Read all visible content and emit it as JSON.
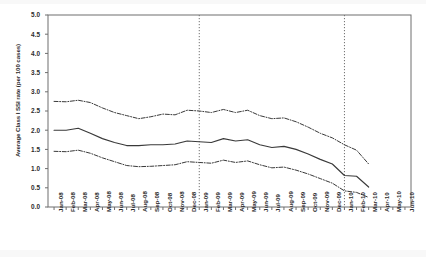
{
  "chart_data": {
    "type": "line",
    "title": "",
    "xlabel": "",
    "ylabel": "Average Class I SSI rate (per 100 cases)",
    "ylim": [
      0.0,
      5.0
    ],
    "ytick_labels": [
      "0.0",
      "0.5",
      "1.0",
      "1.5",
      "2.0",
      "2.5",
      "3.0",
      "3.5",
      "4.0",
      "4.5",
      "5.0"
    ],
    "ytick_values": [
      0.0,
      0.5,
      1.0,
      1.5,
      2.0,
      2.5,
      3.0,
      3.5,
      4.0,
      4.5,
      5.0
    ],
    "grid": false,
    "legend": "none",
    "categories": [
      "Jan-08",
      "Feb-08",
      "Mar-08",
      "Apr-08",
      "May-08",
      "Jun-08",
      "Jul-08",
      "Aug-08",
      "Sep-08",
      "Oct-08",
      "Nov-08",
      "Dec-08",
      "Jan-09",
      "Feb-09",
      "Mar-09",
      "Apr-09",
      "May-09",
      "Jun-09",
      "Jul-09",
      "Aug-09",
      "Sep-09",
      "Oct-09",
      "Nov-09",
      "Dec-09",
      "Jan-10",
      "Feb-10",
      "Mar-10",
      "Apr-10",
      "May-10",
      "Jun-10"
    ],
    "series": [
      {
        "name": "Upper control limit",
        "style": "dash-dot",
        "color": "#3a3a3a",
        "values": [
          2.75,
          2.74,
          2.78,
          2.72,
          2.58,
          2.46,
          2.38,
          2.3,
          2.35,
          2.42,
          2.4,
          2.52,
          2.5,
          2.46,
          2.54,
          2.46,
          2.52,
          2.38,
          2.3,
          2.32,
          2.22,
          2.08,
          1.92,
          1.8,
          1.62,
          1.48,
          1.12,
          null,
          null,
          null
        ]
      },
      {
        "name": "Average Class I SSI rate",
        "style": "solid",
        "color": "#3a3a3a",
        "values": [
          2.0,
          2.0,
          2.05,
          1.92,
          1.78,
          1.68,
          1.6,
          1.6,
          1.62,
          1.62,
          1.64,
          1.72,
          1.7,
          1.68,
          1.78,
          1.72,
          1.75,
          1.62,
          1.55,
          1.58,
          1.5,
          1.38,
          1.24,
          1.12,
          0.82,
          0.8,
          0.52,
          null,
          null,
          null
        ]
      },
      {
        "name": "Lower control limit",
        "style": "dash-dot",
        "color": "#3a3a3a",
        "values": [
          1.45,
          1.44,
          1.48,
          1.4,
          1.28,
          1.18,
          1.08,
          1.05,
          1.06,
          1.08,
          1.1,
          1.18,
          1.16,
          1.14,
          1.22,
          1.16,
          1.2,
          1.1,
          1.02,
          1.04,
          0.96,
          0.86,
          0.74,
          0.62,
          0.42,
          0.38,
          0.25,
          null,
          null,
          null
        ]
      }
    ],
    "reference_lines": [
      {
        "label": "Jan-09",
        "at_category": "Jan-09",
        "style": "dotted"
      },
      {
        "label": "Jan-10",
        "at_category": "Jan-10",
        "style": "dotted"
      }
    ]
  }
}
